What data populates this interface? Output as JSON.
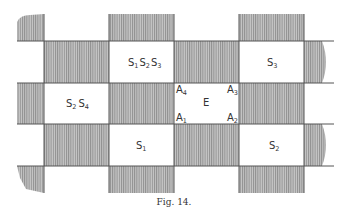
{
  "figure": {
    "caption": "Fig. 14.",
    "colors": {
      "hatch": "#9a9a9a",
      "background": "#ffffff",
      "line": "#555555"
    },
    "grid": {
      "columns_x": [
        17,
        44,
        109,
        174,
        239,
        304,
        330
      ],
      "rows_y": [
        14,
        41,
        83,
        124,
        166,
        193
      ]
    },
    "labels": {
      "s1s2s3": {
        "parts": [
          "S",
          "1",
          "S",
          "2",
          "S",
          "3"
        ]
      },
      "s2s4": {
        "parts": [
          "S",
          "2",
          "S",
          "4"
        ]
      },
      "s3": {
        "base": "S",
        "sub": "3"
      },
      "s1": {
        "base": "S",
        "sub": "1"
      },
      "s2": {
        "base": "S",
        "sub": "2"
      },
      "e": "E",
      "a1": {
        "base": "A",
        "sub": "1"
      },
      "a2": {
        "base": "A",
        "sub": "2"
      },
      "a3": {
        "base": "A",
        "sub": "3"
      },
      "a4": {
        "base": "A",
        "sub": "4"
      }
    }
  }
}
